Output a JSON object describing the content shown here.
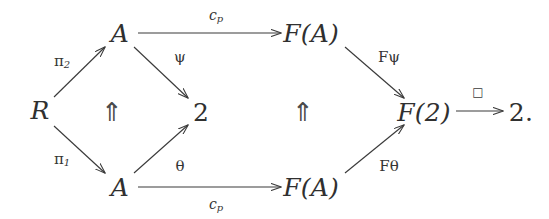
{
  "diagram": {
    "background_color": "#ffffff",
    "ink_color": "#303030",
    "nodes": [
      {
        "id": "R",
        "label": "R",
        "x": 40,
        "y": 110,
        "style": "italic"
      },
      {
        "id": "A_top",
        "label": "A",
        "x": 120,
        "y": 33,
        "style": "italic"
      },
      {
        "id": "A_bottom",
        "label": "A",
        "x": 120,
        "y": 187,
        "style": "italic"
      },
      {
        "id": "two_mid",
        "label": "2",
        "x": 201,
        "y": 112,
        "style": "upright"
      },
      {
        "id": "FA_top",
        "label": "F(A)",
        "x": 311,
        "y": 33,
        "style": "italic"
      },
      {
        "id": "FA_bottom",
        "label": "F(A)",
        "x": 311,
        "y": 187,
        "style": "italic"
      },
      {
        "id": "F2",
        "label": "F(2)",
        "x": 424,
        "y": 112,
        "style": "italic"
      },
      {
        "id": "two_end",
        "label": "2.",
        "x": 521,
        "y": 112,
        "style": "upright"
      }
    ],
    "arrows": [
      {
        "id": "pi2",
        "from": "R",
        "to": "A_top",
        "label_text": "π",
        "label_sub": "2",
        "label_x": 62,
        "label_y": 62,
        "label_kind": "greek-sub"
      },
      {
        "id": "pi1",
        "from": "R",
        "to": "A_bottom",
        "label_text": "π",
        "label_sub": "1",
        "label_x": 62,
        "label_y": 160,
        "label_kind": "greek-sub"
      },
      {
        "id": "psi",
        "from": "A_top",
        "to": "two_mid",
        "label_text": "ψ",
        "label_sub": "",
        "label_x": 180,
        "label_y": 57,
        "label_kind": "greek"
      },
      {
        "id": "theta",
        "from": "A_bottom",
        "to": "two_mid",
        "label_text": "θ",
        "label_sub": "",
        "label_x": 180,
        "label_y": 166,
        "label_kind": "greek"
      },
      {
        "id": "cp_top",
        "from": "A_top",
        "to": "FA_top",
        "label_text": "c",
        "label_sub": "p",
        "label_x": 216,
        "label_y": 16,
        "label_kind": "latin-sub"
      },
      {
        "id": "cp_bot",
        "from": "A_bottom",
        "to": "FA_bottom",
        "label_text": "c",
        "label_sub": "p",
        "label_x": 216,
        "label_y": 205,
        "label_kind": "latin-sub"
      },
      {
        "id": "Fpsi",
        "from": "FA_top",
        "to": "F2",
        "label_text": "Fψ",
        "label_sub": "",
        "label_x": 389,
        "label_y": 57,
        "label_kind": "greek"
      },
      {
        "id": "Ftheta",
        "from": "FA_bottom",
        "to": "F2",
        "label_text": "Fθ",
        "label_sub": "",
        "label_x": 389,
        "label_y": 166,
        "label_kind": "greek"
      },
      {
        "id": "boxmap",
        "from": "F2",
        "to": "two_end",
        "label_text": "□",
        "label_sub": "",
        "label_x": 478,
        "label_y": 92,
        "label_kind": "box"
      }
    ],
    "two_cells": [
      {
        "id": "cell-left",
        "glyph": "⇑",
        "x": 112,
        "y": 112
      },
      {
        "id": "cell-right",
        "glyph": "⇑",
        "x": 303,
        "y": 112
      }
    ]
  }
}
